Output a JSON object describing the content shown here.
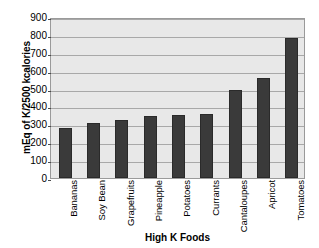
{
  "chart_data": {
    "type": "bar",
    "title": "",
    "xlabel": "High K Foods",
    "ylabel": "mEq of K/2500 kcalories",
    "categories": [
      "Bananas",
      "Soy Bean",
      "Grapefruits",
      "Pineapple",
      "Potatoes",
      "Currants",
      "Cantaloupes",
      "Apricot",
      "Tomatoes"
    ],
    "values": [
      278,
      308,
      327,
      344,
      350,
      359,
      494,
      558,
      785
    ],
    "ylim": [
      0,
      900
    ],
    "ytick_step": 100,
    "yticks": [
      900,
      800,
      700,
      600,
      500,
      400,
      300,
      200,
      100,
      0
    ],
    "grid": true,
    "legend": false,
    "series": [
      {
        "name": "mEq of K/2500 kcalories",
        "values": [
          278,
          308,
          327,
          344,
          350,
          359,
          494,
          558,
          785
        ]
      }
    ]
  },
  "style": {
    "bar_color": "#3a3a3a",
    "plot_background": "#e8e8e8",
    "gridline_color": "#a8a8a8",
    "page_background": "#ffffff",
    "text_color": "#000000"
  }
}
